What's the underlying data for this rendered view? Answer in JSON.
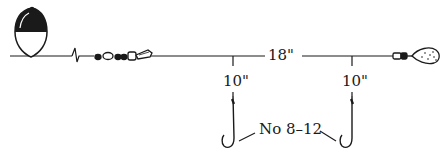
{
  "diagram": {
    "type": "fishing-rig",
    "components": {
      "float": "bobber-icon",
      "swivel": "swivel-icon",
      "sinker": "sinker-icon",
      "hooks": [
        "hook-icon",
        "hook-icon"
      ]
    },
    "labels": {
      "main_line_length": "18\"",
      "dropper_1_length": "10\"",
      "dropper_2_length": "10\"",
      "hook_size": "No 8–12"
    },
    "colors": {
      "ink": "#1a1a1a",
      "background": "#ffffff"
    }
  }
}
